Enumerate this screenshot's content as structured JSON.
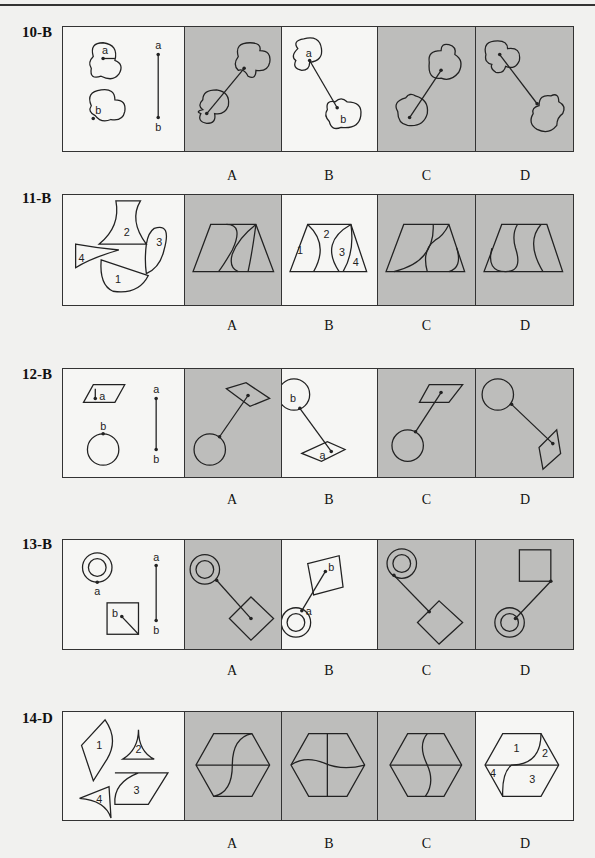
{
  "page": {
    "header_text": ""
  },
  "layout": {
    "cell_widths": [
      121,
      98,
      96,
      99,
      98
    ]
  },
  "questions": [
    {
      "id": "10",
      "label": "10-B",
      "answer": "B",
      "options": [
        "A",
        "B",
        "C",
        "D"
      ],
      "cells": [
        {
          "kind": "prompt",
          "bg": "white",
          "text": [
            "a",
            "b",
            "a",
            "b"
          ]
        },
        {
          "kind": "option",
          "option": "A",
          "bg": "gray"
        },
        {
          "kind": "option",
          "option": "B",
          "bg": "white",
          "text": [
            "a",
            "b"
          ]
        },
        {
          "kind": "option",
          "option": "C",
          "bg": "gray"
        },
        {
          "kind": "option",
          "option": "D",
          "bg": "gray"
        }
      ]
    },
    {
      "id": "11",
      "label": "11-B",
      "answer": "B",
      "options": [
        "A",
        "B",
        "C",
        "D"
      ],
      "cells": [
        {
          "kind": "prompt",
          "bg": "white",
          "text": [
            "2",
            "3",
            "4",
            "1"
          ]
        },
        {
          "kind": "option",
          "option": "A",
          "bg": "gray"
        },
        {
          "kind": "option",
          "option": "B",
          "bg": "white",
          "text": [
            "1",
            "2",
            "3",
            "4"
          ]
        },
        {
          "kind": "option",
          "option": "C",
          "bg": "gray"
        },
        {
          "kind": "option",
          "option": "D",
          "bg": "gray"
        }
      ]
    },
    {
      "id": "12",
      "label": "12-B",
      "answer": "B",
      "options": [
        "A",
        "B",
        "C",
        "D"
      ],
      "cells": [
        {
          "kind": "prompt",
          "bg": "white",
          "text": [
            "a",
            "b",
            "a",
            "b"
          ]
        },
        {
          "kind": "option",
          "option": "A",
          "bg": "gray"
        },
        {
          "kind": "option",
          "option": "B",
          "bg": "white",
          "text": [
            "b",
            "a"
          ]
        },
        {
          "kind": "option",
          "option": "C",
          "bg": "gray"
        },
        {
          "kind": "option",
          "option": "D",
          "bg": "gray"
        }
      ]
    },
    {
      "id": "13",
      "label": "13-B",
      "answer": "B",
      "options": [
        "A",
        "B",
        "C",
        "D"
      ],
      "cells": [
        {
          "kind": "prompt",
          "bg": "white",
          "text": [
            "a",
            "b",
            "a",
            "b"
          ]
        },
        {
          "kind": "option",
          "option": "A",
          "bg": "gray"
        },
        {
          "kind": "option",
          "option": "B",
          "bg": "white",
          "text": [
            "b",
            "a"
          ]
        },
        {
          "kind": "option",
          "option": "C",
          "bg": "gray"
        },
        {
          "kind": "option",
          "option": "D",
          "bg": "gray"
        }
      ]
    },
    {
      "id": "14",
      "label": "14-D",
      "answer": "D",
      "options": [
        "A",
        "B",
        "C",
        "D"
      ],
      "cells": [
        {
          "kind": "prompt",
          "bg": "white",
          "text": [
            "1",
            "2",
            "3",
            "4"
          ]
        },
        {
          "kind": "option",
          "option": "A",
          "bg": "gray"
        },
        {
          "kind": "option",
          "option": "B",
          "bg": "gray"
        },
        {
          "kind": "option",
          "option": "C",
          "bg": "gray"
        },
        {
          "kind": "option",
          "option": "D",
          "bg": "white",
          "text": [
            "1",
            "2",
            "3",
            "4"
          ]
        }
      ]
    }
  ],
  "colors": {
    "ink": "#222222",
    "gray_cell": "#bdbdbb",
    "white_cell": "#f6f6f4",
    "page": "#f1f1ef"
  }
}
